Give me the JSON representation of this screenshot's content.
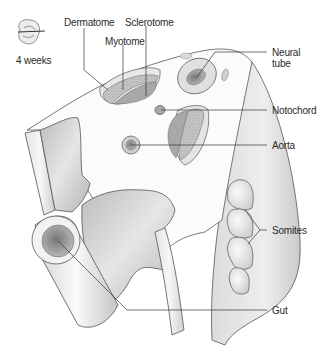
{
  "diagram": {
    "age_icon": {
      "icon": "embryo-icon",
      "label": "4 weeks"
    },
    "labels": {
      "dermatome": "Dermatome",
      "myotome": "Myotome",
      "sclerotome": "Sclerotome",
      "neural_tube_line1": "Neural",
      "neural_tube_line2": "tube",
      "notochord": "Notochord",
      "aorta": "Aorta",
      "somites": "Somites",
      "gut": "Gut"
    },
    "colors": {
      "outline": "#555555",
      "tissue_light": "#f2f2f2",
      "tissue_mid": "#d6d6d6",
      "tissue_dark": "#a9a9a9",
      "leader_line": "#333333",
      "text": "#2a2a2a"
    }
  }
}
